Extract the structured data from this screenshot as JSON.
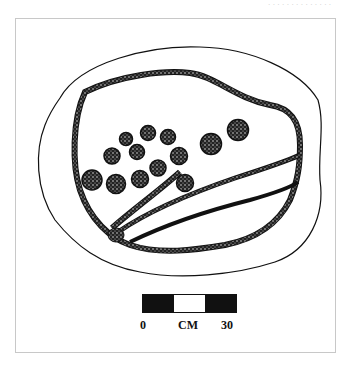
{
  "header": {
    "text": "· · · · · · · · · · · · · ·"
  },
  "figure": {
    "scale_bar": {
      "start_label": "0",
      "unit_label": "CM",
      "end_label": "30",
      "segments": [
        "black",
        "white",
        "black"
      ]
    },
    "circle_count": 14,
    "colors": {
      "ink": "#111111",
      "frame": "#c8c8c8",
      "background": "#ffffff"
    }
  }
}
